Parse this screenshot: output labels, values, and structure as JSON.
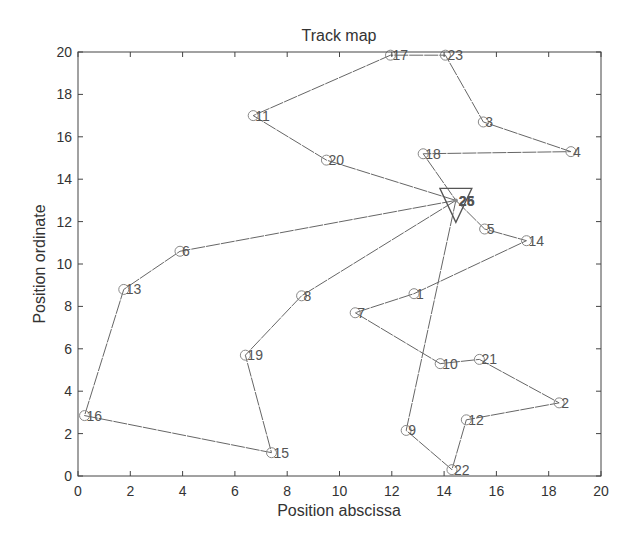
{
  "chart_data": {
    "type": "line",
    "title": "Track map",
    "xlabel": "Position abscissa",
    "ylabel": "Position ordinate",
    "xlim": [
      0,
      20
    ],
    "ylim": [
      0,
      20
    ],
    "xticks": [
      0,
      2,
      4,
      6,
      8,
      10,
      12,
      14,
      16,
      18,
      20
    ],
    "yticks": [
      0,
      2,
      4,
      6,
      8,
      10,
      12,
      14,
      16,
      18,
      20
    ],
    "grid": false,
    "legend": null,
    "depot": {
      "x": 14.45,
      "y": 13.0,
      "labels": [
        "25",
        "26"
      ],
      "marker": "triangle-down"
    },
    "nodes": [
      {
        "id": 1,
        "x": 12.85,
        "y": 8.6
      },
      {
        "id": 2,
        "x": 18.4,
        "y": 3.45
      },
      {
        "id": 3,
        "x": 15.5,
        "y": 16.7
      },
      {
        "id": 4,
        "x": 18.85,
        "y": 15.3
      },
      {
        "id": 5,
        "x": 15.55,
        "y": 11.65
      },
      {
        "id": 6,
        "x": 3.9,
        "y": 10.6
      },
      {
        "id": 7,
        "x": 10.6,
        "y": 7.7
      },
      {
        "id": 8,
        "x": 8.55,
        "y": 8.5
      },
      {
        "id": 9,
        "x": 12.55,
        "y": 2.15
      },
      {
        "id": 10,
        "x": 13.85,
        "y": 5.3
      },
      {
        "id": 11,
        "x": 6.7,
        "y": 17.0
      },
      {
        "id": 12,
        "x": 14.85,
        "y": 2.65
      },
      {
        "id": 13,
        "x": 1.75,
        "y": 8.8
      },
      {
        "id": 14,
        "x": 17.15,
        "y": 11.1
      },
      {
        "id": 15,
        "x": 7.4,
        "y": 1.1
      },
      {
        "id": 16,
        "x": 0.25,
        "y": 2.85
      },
      {
        "id": 17,
        "x": 11.95,
        "y": 19.85
      },
      {
        "id": 18,
        "x": 13.2,
        "y": 15.2
      },
      {
        "id": 19,
        "x": 6.4,
        "y": 5.7
      },
      {
        "id": 20,
        "x": 9.5,
        "y": 14.9
      },
      {
        "id": 21,
        "x": 15.35,
        "y": 5.5
      },
      {
        "id": 22,
        "x": 14.3,
        "y": 0.3
      },
      {
        "id": 23,
        "x": 14.05,
        "y": 19.85
      }
    ],
    "series": [
      {
        "name": "route-1",
        "sequence": [
          "depot",
          20,
          11,
          17,
          23,
          3,
          4,
          18,
          "depot"
        ]
      },
      {
        "name": "route-2",
        "sequence": [
          "depot",
          5,
          14,
          1,
          7,
          10,
          21,
          2,
          12,
          22,
          9,
          "depot"
        ]
      },
      {
        "name": "route-3",
        "sequence": [
          "depot",
          6,
          13,
          16,
          15,
          19,
          8,
          "depot"
        ]
      }
    ],
    "style": {
      "line_color": "#666666",
      "marker_color": "#888888",
      "axis_color": "#444444"
    }
  }
}
